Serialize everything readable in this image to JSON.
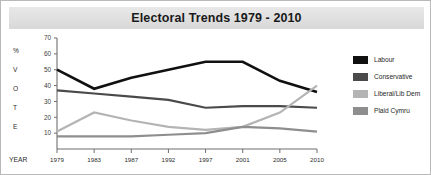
{
  "chart": {
    "title": "Electoral Trends 1979 - 2010",
    "year_axis_label": "YEAR",
    "vertical_axis_letters": [
      "%",
      "V",
      "O",
      "T",
      "E"
    ]
  },
  "legend": {
    "items": [
      {
        "label": "Labour",
        "color": "#101010"
      },
      {
        "label": "Conservative",
        "color": "#4a4a4a"
      },
      {
        "label": "Liberal/Lib Dem",
        "color": "#b4b4b4"
      },
      {
        "label": "Plaid Cymru",
        "color": "#8e8e8e"
      }
    ]
  },
  "chart_data": {
    "type": "line",
    "title": "Electoral Trends 1979 - 2010",
    "xlabel": "YEAR",
    "ylabel": "% VOTE",
    "categories": [
      "1979",
      "1983",
      "1987",
      "1992",
      "1997",
      "2001",
      "2005",
      "2010"
    ],
    "yticks": [
      10,
      20,
      30,
      40,
      50,
      60,
      70
    ],
    "ylim": [
      0,
      70
    ],
    "grid": false,
    "legend_position": "right",
    "series": [
      {
        "name": "Labour",
        "color": "#101010",
        "values": [
          50,
          38,
          45,
          50,
          55,
          55,
          43,
          36
        ]
      },
      {
        "name": "Conservative",
        "color": "#4a4a4a",
        "values": [
          37,
          35,
          33,
          31,
          26,
          27,
          27,
          26
        ]
      },
      {
        "name": "Liberal/Lib Dem",
        "color": "#b4b4b4",
        "values": [
          11,
          23,
          18,
          14,
          12,
          14,
          23,
          40
        ]
      },
      {
        "name": "Plaid Cymru",
        "color": "#8e8e8e",
        "values": [
          8,
          8,
          8,
          9,
          10,
          14,
          13,
          11
        ]
      }
    ]
  }
}
